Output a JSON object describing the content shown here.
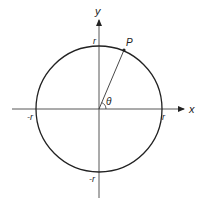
{
  "diagram": {
    "type": "unit-circle-polar",
    "axes": {
      "x_label": "x",
      "y_label": "y"
    },
    "circle": {
      "radius_label": "r",
      "intercepts": {
        "top": "r",
        "bottom": "-r",
        "left": "-r",
        "right": "r"
      }
    },
    "point": {
      "label": "P"
    },
    "angle": {
      "label": "θ"
    },
    "colors": {
      "stroke": "#222222",
      "background": "#ffffff"
    }
  }
}
